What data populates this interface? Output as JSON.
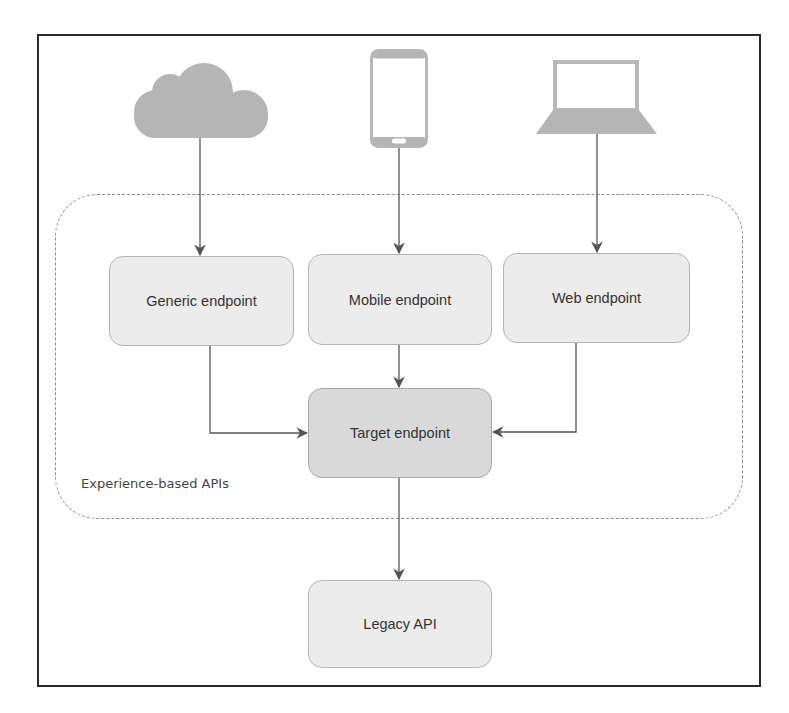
{
  "diagram": {
    "type": "architecture-flow",
    "clients": [
      {
        "id": "cloud",
        "icon": "cloud-icon",
        "label": ""
      },
      {
        "id": "mobile",
        "icon": "smartphone-icon",
        "label": ""
      },
      {
        "id": "web",
        "icon": "laptop-icon",
        "label": ""
      }
    ],
    "group": {
      "label": "Experience-based APIs"
    },
    "nodes": {
      "generic": {
        "label": "Generic endpoint"
      },
      "mobile": {
        "label": "Mobile endpoint"
      },
      "web": {
        "label": "Web endpoint"
      },
      "target": {
        "label": "Target endpoint"
      },
      "legacy": {
        "label": "Legacy API"
      }
    },
    "edges": [
      {
        "from": "cloud",
        "to": "generic"
      },
      {
        "from": "mobile-device",
        "to": "mobile"
      },
      {
        "from": "laptop",
        "to": "web"
      },
      {
        "from": "generic",
        "to": "target"
      },
      {
        "from": "mobile",
        "to": "target"
      },
      {
        "from": "web",
        "to": "target"
      },
      {
        "from": "target",
        "to": "legacy"
      }
    ],
    "colors": {
      "node_fill": "#ececec",
      "target_fill": "#d9d9d9",
      "icon_fill": "#b3b3b3",
      "edge": "#555555",
      "frame": "#2a2a2a"
    }
  }
}
